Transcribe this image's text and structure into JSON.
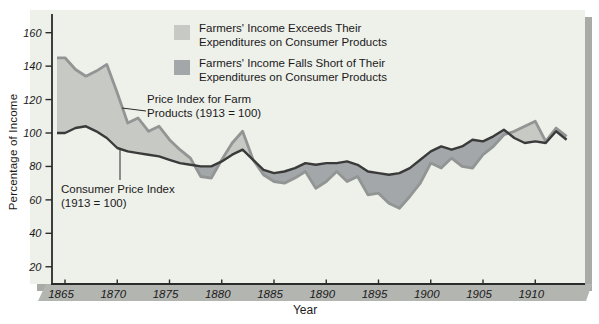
{
  "figure": {
    "y_axis_label": "Percentage of Income",
    "x_axis_label": "Year",
    "legend": [
      {
        "line1": "Farmers' Income Exceeds Their",
        "line2": "Expenditures on Consumer Products",
        "color": "#c7c9c5"
      },
      {
        "line1": "Farmers' Income Falls Short of Their",
        "line2": "Expenditures on Consumer Products",
        "color": "#a3a7a9"
      }
    ],
    "annotations": {
      "farm": {
        "line1": "Price Index for Farm",
        "line2": "Products (1913 = 100)"
      },
      "cpi": {
        "line1": "Consumer Price Index",
        "line2": "(1913 = 100)"
      }
    },
    "colors": {
      "panel_bg": "#eef0ea",
      "panel_shadow": "#a9aba7",
      "band": "#b3b5b1",
      "axis": "#2b2b2b",
      "farm_line": "#919593",
      "cpi_line": "#3a3a3a",
      "fill_exceeds": "#c7c9c5",
      "fill_falls_short": "#a3a7a9",
      "text": "#1a1a1a"
    }
  },
  "chart_data": {
    "type": "area",
    "title": "",
    "xlabel": "Year",
    "ylabel": "Percentage of Income",
    "x_ticks": [
      1865,
      1870,
      1875,
      1880,
      1885,
      1890,
      1895,
      1900,
      1905,
      1910
    ],
    "y_ticks": [
      20,
      40,
      60,
      80,
      100,
      120,
      140,
      160
    ],
    "xlim": [
      1864,
      1914
    ],
    "ylim": [
      10,
      170
    ],
    "grid": false,
    "legend_position": "top-center",
    "x": [
      1865,
      1866,
      1867,
      1868,
      1869,
      1870,
      1871,
      1872,
      1873,
      1874,
      1875,
      1876,
      1877,
      1878,
      1879,
      1880,
      1881,
      1882,
      1883,
      1884,
      1885,
      1886,
      1887,
      1888,
      1889,
      1890,
      1891,
      1892,
      1893,
      1894,
      1895,
      1896,
      1897,
      1898,
      1899,
      1900,
      1901,
      1902,
      1903,
      1904,
      1905,
      1906,
      1907,
      1908,
      1909,
      1910,
      1911,
      1912,
      1913
    ],
    "series": [
      {
        "name": "Price Index for Farm Products (1913 = 100)",
        "values": [
          145,
          138,
          134,
          137,
          141,
          124,
          106,
          109,
          101,
          104,
          96,
          90,
          85,
          74,
          73,
          84,
          94,
          101,
          84,
          75,
          71,
          70,
          73,
          77,
          67,
          71,
          77,
          71,
          74,
          63,
          64,
          58,
          55,
          62,
          70,
          82,
          79,
          85,
          80,
          79,
          87,
          92,
          99,
          101,
          104,
          107,
          95,
          103,
          98
        ]
      },
      {
        "name": "Consumer Price Index (1913 = 100)",
        "values": [
          100,
          103,
          104,
          101,
          97,
          91,
          89,
          88,
          87,
          86,
          84,
          82,
          81,
          80,
          80,
          83,
          87,
          90,
          84,
          78,
          76,
          77,
          79,
          82,
          81,
          82,
          82,
          83,
          81,
          77,
          76,
          75,
          76,
          79,
          84,
          89,
          92,
          90,
          92,
          96,
          95,
          98,
          102,
          97,
          94,
          95,
          94,
          101,
          96
        ]
      }
    ],
    "shading": {
      "exceeds": "area where farm index is above consumer price index (light gray)",
      "falls_short": "area where farm index is below consumer price index (dark gray)"
    }
  }
}
